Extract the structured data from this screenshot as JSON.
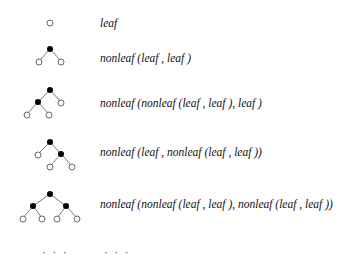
{
  "rows": [
    {
      "term": "leaf"
    },
    {
      "term": "nonleaf (leaf , leaf )"
    },
    {
      "term": "nonleaf (nonleaf (leaf , leaf ),  leaf )"
    },
    {
      "term": "nonleaf (leaf ,  nonleaf (leaf , leaf ))"
    },
    {
      "term": "nonleaf (nonleaf (leaf , leaf ),  nonleaf (leaf , leaf ))"
    }
  ],
  "continuation": {
    "tree": "· · ·",
    "term": "· · ·"
  },
  "legend": {
    "leaf_node": "hollow circle",
    "nonleaf_node": "filled circle"
  },
  "colors": {
    "line": "#555555",
    "node_fill": "#000000",
    "leaf_stroke": "#444444"
  }
}
